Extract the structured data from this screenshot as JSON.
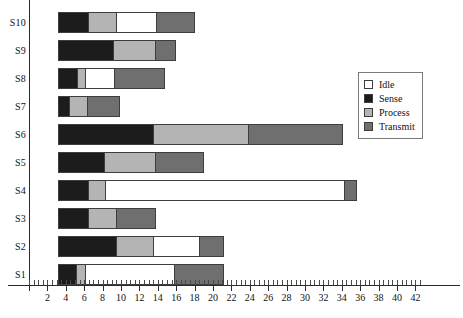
{
  "chart_data": {
    "type": "bar",
    "orientation": "horizontal",
    "stacked": true,
    "title": "",
    "xlabel": "",
    "ylabel": "",
    "xlim": [
      0,
      43
    ],
    "ylim": [
      0,
      10
    ],
    "grid": false,
    "legend_position": "right-top",
    "categories": [
      "S1",
      "S2",
      "S3",
      "S4",
      "S5",
      "S6",
      "S7",
      "S8",
      "S9",
      "S10"
    ],
    "series": [
      {
        "name": "Sense",
        "color": "#1c1c1c",
        "values": [
          2.0,
          6.3,
          3.3,
          3.3,
          5.0,
          10.3,
          1.2,
          2.1,
          6.0,
          3.3
        ]
      },
      {
        "name": "Process",
        "color": "#b4b4b4",
        "values": [
          0.9,
          4.0,
          3.0,
          1.8,
          5.5,
          10.4,
          1.9,
          0.8,
          4.5,
          3.0
        ]
      },
      {
        "name": "Idle",
        "color": "#ffffff",
        "values": [
          9.7,
          5.0,
          0.0,
          26.0,
          0.0,
          0.0,
          0.0,
          3.2,
          0.0,
          4.4
        ]
      },
      {
        "name": "Transmit",
        "color": "#6f6f6f",
        "values": [
          5.5,
          2.7,
          4.4,
          1.4,
          5.4,
          10.3,
          3.6,
          5.5,
          2.3,
          4.2
        ]
      }
    ],
    "segment_order": [
      "Sense",
      "Process",
      "Idle",
      "Transmit"
    ],
    "totals": [
      18.1,
      18.0,
      10.7,
      32.5,
      15.9,
      31.0,
      6.7,
      11.6,
      12.8,
      14.9
    ],
    "xticks": [
      0,
      2,
      4,
      6,
      8,
      10,
      12,
      14,
      16,
      18,
      20,
      22,
      24,
      26,
      28,
      30,
      32,
      34,
      36,
      38,
      40,
      42
    ],
    "xtick_labels": [
      "",
      "2",
      "4",
      "6",
      "8",
      "10",
      "12",
      "14",
      "16",
      "18",
      "20",
      "22",
      "24",
      "26",
      "28",
      "30",
      "32",
      "34",
      "36",
      "38",
      "40",
      "42"
    ],
    "minor_tick_step": 0.5
  },
  "legend": {
    "items": [
      {
        "label": "Idle",
        "key": "idle"
      },
      {
        "label": "Sense",
        "key": "sense"
      },
      {
        "label": "Process",
        "key": "process"
      },
      {
        "label": "Transmit",
        "key": "transmit"
      }
    ]
  },
  "colors": {
    "idle": "#ffffff",
    "sense": "#1c1c1c",
    "process": "#b4b4b4",
    "transmit": "#6f6f6f",
    "axis": "#2b2b2b",
    "text": "#111111",
    "background": "#ffffff"
  }
}
